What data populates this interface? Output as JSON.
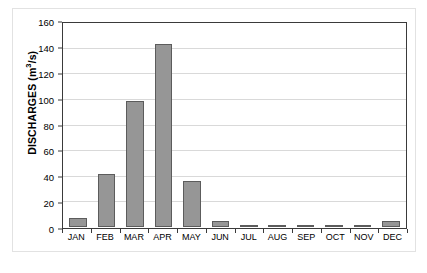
{
  "chart_data": {
    "type": "bar",
    "title": "",
    "subtitle": "",
    "xlabel": "",
    "ylabel": "DISCHARGES (m³/s)",
    "ylabel_text": "DISCHARGES (m",
    "ylabel_sup": "3",
    "ylabel_tail": "/s)",
    "categories": [
      "JAN",
      "FEB",
      "MAR",
      "APR",
      "MAY",
      "JUN",
      "JUL",
      "AUG",
      "SEP",
      "OCT",
      "NOV",
      "DEC"
    ],
    "values": [
      7,
      41,
      98,
      143,
      36,
      5,
      1.5,
      0.4,
      0.2,
      0.2,
      0.3,
      5
    ],
    "ylim": [
      0,
      160
    ],
    "ytick_values": [
      0,
      20,
      40,
      60,
      80,
      100,
      120,
      140,
      160
    ],
    "ytick_labels": [
      "0",
      "20",
      "40",
      "60",
      "80",
      "100",
      "120",
      "140",
      "160"
    ],
    "grid": true,
    "legend": false,
    "legend_position": "none",
    "series": [
      {
        "name": "Discharges",
        "values": [
          7,
          41,
          98,
          143,
          36,
          5,
          1.5,
          0.4,
          0.2,
          0.2,
          0.3,
          5
        ]
      }
    ],
    "colors": {
      "bar_fill": "#969696",
      "bar_border": "#5c5c5c",
      "gridline": "#d9d9d9",
      "axis": "#3a3a3a",
      "text": "#000000",
      "background": "#ffffff",
      "figure_border": "#e2e2e2"
    }
  },
  "caption": ""
}
